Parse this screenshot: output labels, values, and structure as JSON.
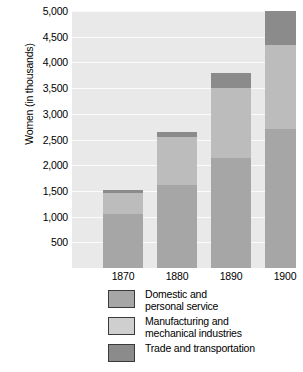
{
  "chart_data": {
    "type": "bar",
    "subtype": "stacked-bar",
    "title": "",
    "xlabel": "",
    "ylabel": "Women (in thousands)",
    "categories": [
      "1870",
      "1880",
      "1890",
      "1900"
    ],
    "series": [
      {
        "name": "Domestic and personal service",
        "color": "#a6a6a6",
        "values": [
          1050,
          1620,
          2150,
          2700
        ]
      },
      {
        "name": "Manufacturing and mechanical industries",
        "color": "#bcbcbc",
        "values": [
          400,
          930,
          1350,
          1640
        ]
      },
      {
        "name": "Trade and transportation",
        "color": "#8b8b8b",
        "values": [
          60,
          100,
          290,
          660
        ]
      }
    ],
    "totals": [
      1510,
      2650,
      3790,
      5000
    ],
    "ylim": [
      0,
      5000
    ],
    "yticks": [
      500,
      1000,
      1500,
      2000,
      2500,
      3000,
      3500,
      4000,
      4500,
      5000
    ],
    "ytick_labels": [
      "500",
      "1,000",
      "1,500",
      "2,000",
      "2,500",
      "3,000",
      "3,500",
      "4,000",
      "4,500",
      "5,000"
    ],
    "grid": true,
    "grid_axis": "y",
    "legend_position": "bottom",
    "plot_background": "#e9e9e9",
    "gridline_color": "#fbfbfb"
  },
  "legend": {
    "items": [
      {
        "label": "Domestic and\npersonal service",
        "swatch_class": "sw-domestic"
      },
      {
        "label": "Manufacturing and\nmechanical industries",
        "swatch_class": "sw-manufacturing"
      },
      {
        "label": "Trade and transportation",
        "swatch_class": "sw-trade"
      }
    ]
  }
}
